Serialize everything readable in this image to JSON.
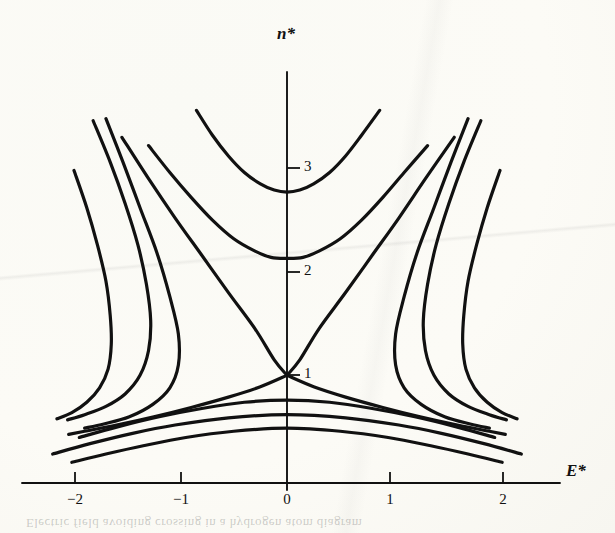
{
  "figure": {
    "kind": "scientific-plot",
    "title": "",
    "ghost_caption": "Electric field avoiding crossing in a hydrogen atom diagram"
  },
  "axes": {
    "x_label": "E*",
    "y_label": "n*",
    "x_ticks": [
      {
        "value": -2,
        "label": "−2",
        "px": 75
      },
      {
        "value": -1,
        "label": "−1",
        "px": 181
      },
      {
        "value": 0,
        "label": "0",
        "px": 287
      },
      {
        "value": 1,
        "label": "1",
        "px": 390
      },
      {
        "value": 2,
        "label": "2",
        "px": 503
      }
    ],
    "y_ticks": [
      {
        "value": 1,
        "label": "1",
        "px": 375
      },
      {
        "value": 2,
        "label": "2",
        "px": 272
      },
      {
        "value": 3,
        "label": "3",
        "px": 168
      }
    ],
    "x_axis_y_px": 483,
    "y_axis_x_px": 287,
    "x_axis_span_px": [
      22,
      560
    ],
    "y_axis_span_px": [
      72,
      490
    ],
    "units_per_px_x": 106.5,
    "units_per_px_y": 103.5,
    "line_color": "#111111"
  },
  "chart_data": {
    "type": "line",
    "title": "",
    "xlabel": "E*",
    "ylabel": "n*",
    "xlim": [
      -2.6,
      2.6
    ],
    "ylim": [
      0,
      4.1
    ],
    "grid": false,
    "legend": null,
    "series": [
      {
        "name": "upper-manifold-n3",
        "shape": "u-curve",
        "vertex": [
          0,
          2.81
        ],
        "points": [
          [
            -0.85,
            3.6
          ],
          [
            -0.7,
            3.36
          ],
          [
            -0.55,
            3.16
          ],
          [
            -0.4,
            3.0
          ],
          [
            -0.25,
            2.89
          ],
          [
            -0.12,
            2.83
          ],
          [
            0,
            2.81
          ],
          [
            0.12,
            2.83
          ],
          [
            0.25,
            2.89
          ],
          [
            0.4,
            3.0
          ],
          [
            0.55,
            3.16
          ],
          [
            0.7,
            3.36
          ],
          [
            0.87,
            3.6
          ]
        ]
      },
      {
        "name": "upper-manifold-n2",
        "shape": "u-curve",
        "vertex": [
          0,
          2.17
        ],
        "points": [
          [
            -1.3,
            3.26
          ],
          [
            -1.1,
            3.0
          ],
          [
            -0.9,
            2.76
          ],
          [
            -0.7,
            2.54
          ],
          [
            -0.5,
            2.36
          ],
          [
            -0.3,
            2.24
          ],
          [
            -0.15,
            2.18
          ],
          [
            0,
            2.17
          ],
          [
            0.15,
            2.18
          ],
          [
            0.3,
            2.24
          ],
          [
            0.5,
            2.36
          ],
          [
            0.7,
            2.54
          ],
          [
            0.9,
            2.76
          ],
          [
            1.1,
            3.0
          ],
          [
            1.32,
            3.26
          ]
        ]
      },
      {
        "name": "crossing-branch-upper-left",
        "shape": "line-through-crossing",
        "points": [
          [
            -1.55,
            3.34
          ],
          [
            -1.3,
            2.94
          ],
          [
            -1.05,
            2.56
          ],
          [
            -0.8,
            2.2
          ],
          [
            -0.55,
            1.84
          ],
          [
            -0.3,
            1.49
          ],
          [
            -0.12,
            1.19
          ],
          [
            0,
            1.04
          ]
        ]
      },
      {
        "name": "crossing-branch-upper-right",
        "shape": "line-through-crossing",
        "points": [
          [
            0,
            1.04
          ],
          [
            0.12,
            1.19
          ],
          [
            0.3,
            1.49
          ],
          [
            0.55,
            1.84
          ],
          [
            0.8,
            2.2
          ],
          [
            1.05,
            2.56
          ],
          [
            1.3,
            2.94
          ],
          [
            1.57,
            3.34
          ]
        ]
      },
      {
        "name": "crossing-branch-lower-right",
        "shape": "descending-from-crossing",
        "points": [
          [
            0,
            1.04
          ],
          [
            0.25,
            0.93
          ],
          [
            0.55,
            0.83
          ],
          [
            0.9,
            0.73
          ],
          [
            1.25,
            0.64
          ],
          [
            1.6,
            0.56
          ],
          [
            1.9,
            0.5
          ],
          [
            2.05,
            0.47
          ]
        ]
      },
      {
        "name": "crossing-branch-lower-left",
        "shape": "descending-from-crossing",
        "points": [
          [
            -2.05,
            0.47
          ],
          [
            -1.9,
            0.5
          ],
          [
            -1.6,
            0.56
          ],
          [
            -1.25,
            0.64
          ],
          [
            -0.9,
            0.73
          ],
          [
            -0.55,
            0.83
          ],
          [
            -0.25,
            0.93
          ],
          [
            0,
            1.04
          ]
        ]
      },
      {
        "name": "s-curve-outer-left",
        "shape": "s-curve",
        "points": [
          [
            -2.0,
            3.02
          ],
          [
            -1.88,
            2.66
          ],
          [
            -1.78,
            2.3
          ],
          [
            -1.7,
            1.95
          ],
          [
            -1.66,
            1.62
          ],
          [
            -1.65,
            1.34
          ],
          [
            -1.68,
            1.1
          ],
          [
            -1.76,
            0.92
          ],
          [
            -1.88,
            0.78
          ],
          [
            -2.02,
            0.68
          ],
          [
            -2.16,
            0.62
          ]
        ]
      },
      {
        "name": "s-curve-mid-left",
        "shape": "s-curve",
        "points": [
          [
            -1.82,
            3.5
          ],
          [
            -1.66,
            3.1
          ],
          [
            -1.52,
            2.7
          ],
          [
            -1.4,
            2.3
          ],
          [
            -1.32,
            1.92
          ],
          [
            -1.28,
            1.57
          ],
          [
            -1.3,
            1.28
          ],
          [
            -1.38,
            1.04
          ],
          [
            -1.52,
            0.86
          ],
          [
            -1.7,
            0.74
          ],
          [
            -1.9,
            0.66
          ],
          [
            -2.06,
            0.61
          ]
        ]
      },
      {
        "name": "s-curve-inner-left",
        "shape": "s-curve",
        "points": [
          [
            -1.7,
            3.52
          ],
          [
            -1.54,
            3.1
          ],
          [
            -1.38,
            2.66
          ],
          [
            -1.22,
            2.22
          ],
          [
            -1.1,
            1.8
          ],
          [
            -1.02,
            1.44
          ],
          [
            -1.02,
            1.14
          ],
          [
            -1.1,
            0.92
          ],
          [
            -1.26,
            0.76
          ],
          [
            -1.48,
            0.64
          ],
          [
            -1.72,
            0.57
          ],
          [
            -1.9,
            0.53
          ]
        ]
      },
      {
        "name": "s-curve-outer-right",
        "shape": "s-curve",
        "points": [
          [
            2.0,
            3.02
          ],
          [
            1.88,
            2.66
          ],
          [
            1.78,
            2.3
          ],
          [
            1.7,
            1.95
          ],
          [
            1.66,
            1.62
          ],
          [
            1.65,
            1.34
          ],
          [
            1.68,
            1.1
          ],
          [
            1.76,
            0.92
          ],
          [
            1.88,
            0.78
          ],
          [
            2.02,
            0.68
          ],
          [
            2.16,
            0.62
          ]
        ]
      },
      {
        "name": "s-curve-mid-right",
        "shape": "s-curve",
        "points": [
          [
            1.82,
            3.5
          ],
          [
            1.66,
            3.1
          ],
          [
            1.52,
            2.7
          ],
          [
            1.4,
            2.3
          ],
          [
            1.32,
            1.92
          ],
          [
            1.28,
            1.57
          ],
          [
            1.3,
            1.28
          ],
          [
            1.38,
            1.04
          ],
          [
            1.52,
            0.86
          ],
          [
            1.7,
            0.74
          ],
          [
            1.9,
            0.66
          ],
          [
            2.06,
            0.61
          ]
        ]
      },
      {
        "name": "s-curve-inner-right",
        "shape": "s-curve",
        "points": [
          [
            1.7,
            3.52
          ],
          [
            1.54,
            3.1
          ],
          [
            1.38,
            2.66
          ],
          [
            1.22,
            2.22
          ],
          [
            1.1,
            1.8
          ],
          [
            1.02,
            1.44
          ],
          [
            1.02,
            1.14
          ],
          [
            1.1,
            0.92
          ],
          [
            1.26,
            0.76
          ],
          [
            1.48,
            0.64
          ],
          [
            1.72,
            0.57
          ],
          [
            1.9,
            0.53
          ]
        ]
      },
      {
        "name": "lower-arc-1",
        "shape": "arc",
        "apex": [
          0,
          0.8
        ],
        "points": [
          [
            -1.95,
            0.44
          ],
          [
            -1.6,
            0.54
          ],
          [
            -1.2,
            0.64
          ],
          [
            -0.8,
            0.72
          ],
          [
            -0.4,
            0.78
          ],
          [
            0,
            0.8
          ],
          [
            0.4,
            0.78
          ],
          [
            0.8,
            0.72
          ],
          [
            1.2,
            0.64
          ],
          [
            1.6,
            0.54
          ],
          [
            1.95,
            0.44
          ]
        ]
      },
      {
        "name": "lower-arc-2",
        "shape": "arc",
        "apex": [
          0,
          0.66
        ],
        "points": [
          [
            -2.2,
            0.28
          ],
          [
            -1.85,
            0.38
          ],
          [
            -1.45,
            0.48
          ],
          [
            -1.05,
            0.56
          ],
          [
            -0.55,
            0.63
          ],
          [
            0,
            0.66
          ],
          [
            0.55,
            0.63
          ],
          [
            1.05,
            0.56
          ],
          [
            1.45,
            0.48
          ],
          [
            1.85,
            0.38
          ],
          [
            2.2,
            0.28
          ]
        ]
      },
      {
        "name": "lower-arc-3",
        "shape": "arc",
        "apex": [
          0,
          0.53
        ],
        "points": [
          [
            -2.02,
            0.2
          ],
          [
            -1.7,
            0.28
          ],
          [
            -1.35,
            0.36
          ],
          [
            -0.95,
            0.44
          ],
          [
            -0.5,
            0.5
          ],
          [
            0,
            0.53
          ],
          [
            0.5,
            0.5
          ],
          [
            0.95,
            0.44
          ],
          [
            1.35,
            0.36
          ],
          [
            1.7,
            0.28
          ],
          [
            2.02,
            0.2
          ]
        ]
      }
    ]
  }
}
